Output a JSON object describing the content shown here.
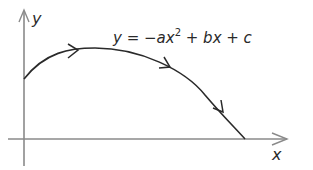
{
  "diagram": {
    "axes": {
      "y_label": "y",
      "x_label": "x"
    },
    "curve": {
      "equation_parts": {
        "lhs": "y = −ax",
        "exponent": "2",
        "rhs": " + bx + c"
      },
      "description": "Downward-opening parabola with arrows indicating direction of travel"
    },
    "colors": {
      "axis": "#8a8a8a",
      "curve": "#2a2a2a",
      "background": "#ffffff"
    }
  }
}
